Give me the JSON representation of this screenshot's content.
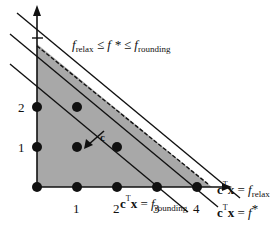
{
  "diagram": {
    "bound_label": {
      "f_relax": "f",
      "f_relax_sub": "relax",
      "leq1": " ≤ ",
      "f_star": "f *",
      "leq2": " ≤ ",
      "f_round": "f",
      "f_round_sub": "rounding"
    },
    "x_ticks": [
      "1",
      "2",
      "3",
      "4"
    ],
    "y_ticks": [
      "1",
      "2"
    ],
    "cost_vector_label": "c",
    "line_labels": {
      "relax": {
        "lhs": "c",
        "sup": "T",
        "x": "x",
        "eq": " = ",
        "f": "f",
        "sub": "relax"
      },
      "star": {
        "lhs": "c",
        "sup": "T",
        "x": "x",
        "eq": " = ",
        "f": "f",
        "sup2": "*"
      },
      "rounding": {
        "lhs": "c",
        "sup": "T",
        "x": "x",
        "eq": " = ",
        "f": "f",
        "sub": "rounding"
      }
    },
    "colors": {
      "feasible_region": "#a8a8a8",
      "lines": "#111111",
      "points": "#111111"
    }
  }
}
